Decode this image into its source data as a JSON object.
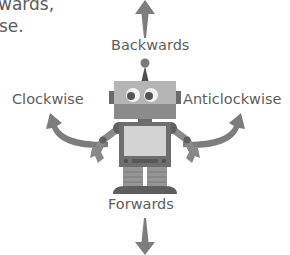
{
  "intro_text": {
    "line1": "wards,",
    "line2": "se."
  },
  "labels": {
    "top": "Backwards",
    "left": "Clockwise",
    "right": "Anticlockwise",
    "bottom": "Forwards"
  },
  "colors": {
    "arrow": "#7d7d7d",
    "robot_dark": "#6f6f6f",
    "robot_mid": "#9a9a9a",
    "robot_light": "#c9c9c9",
    "text": "#5e5e5e"
  }
}
